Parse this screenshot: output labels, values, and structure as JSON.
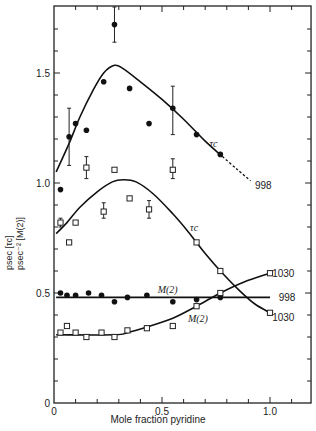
{
  "chart_data": {
    "type": "scatter",
    "title": "",
    "xlabel": "Mole fraction pyridine",
    "ylabel_line1": "psec [τc]",
    "ylabel_line2": "psec⁻² [M(2)]",
    "xlim": [
      0,
      1.19
    ],
    "ylim": [
      0,
      1.8
    ],
    "x_ticks": [
      0,
      0.5,
      1.0
    ],
    "x_tick_labels": [
      "0",
      "0.5",
      "1.0"
    ],
    "y_ticks": [
      0,
      0.5,
      1.0,
      1.5
    ],
    "y_tick_labels": [
      "0",
      "0.5",
      "1.0",
      "1.5"
    ],
    "grid": false,
    "series": [
      {
        "name": "τc (998)",
        "marker": "filled-circle",
        "points": [
          {
            "x": 0.03,
            "y": 0.97
          },
          {
            "x": 0.07,
            "y": 1.21,
            "err": [
              1.08,
              1.34
            ]
          },
          {
            "x": 0.1,
            "y": 1.27
          },
          {
            "x": 0.15,
            "y": 1.24
          },
          {
            "x": 0.23,
            "y": 1.46
          },
          {
            "x": 0.28,
            "y": 1.72,
            "err": [
              1.64,
              1.8
            ]
          },
          {
            "x": 0.35,
            "y": 1.43
          },
          {
            "x": 0.44,
            "y": 1.27
          },
          {
            "x": 0.55,
            "y": 1.34,
            "err": [
              1.22,
              1.44
            ]
          },
          {
            "x": 0.66,
            "y": 1.22
          },
          {
            "x": 0.77,
            "y": 1.13
          }
        ],
        "curve": [
          [
            0.01,
            1.05
          ],
          [
            0.07,
            1.18
          ],
          [
            0.12,
            1.3
          ],
          [
            0.18,
            1.42
          ],
          [
            0.23,
            1.5
          ],
          [
            0.28,
            1.535
          ],
          [
            0.32,
            1.52
          ],
          [
            0.4,
            1.46
          ],
          [
            0.5,
            1.38
          ],
          [
            0.6,
            1.29
          ],
          [
            0.7,
            1.19
          ],
          [
            0.78,
            1.12
          ]
        ],
        "dashed_curve": [
          [
            0.78,
            1.12
          ],
          [
            0.85,
            1.06
          ],
          [
            0.91,
            1.01
          ]
        ],
        "end_label": "998",
        "curve_label": "τc"
      },
      {
        "name": "τc (1030)",
        "marker": "open-square",
        "points": [
          {
            "x": 0.03,
            "y": 0.82,
            "err": [
              0.8,
              0.84
            ]
          },
          {
            "x": 0.07,
            "y": 0.73
          },
          {
            "x": 0.1,
            "y": 0.82
          },
          {
            "x": 0.15,
            "y": 1.07,
            "err": [
              1.02,
              1.12
            ]
          },
          {
            "x": 0.23,
            "y": 0.87,
            "err": [
              0.84,
              0.91
            ]
          },
          {
            "x": 0.28,
            "y": 1.06
          },
          {
            "x": 0.35,
            "y": 0.93
          },
          {
            "x": 0.44,
            "y": 0.88,
            "err": [
              0.84,
              0.92
            ]
          },
          {
            "x": 0.55,
            "y": 1.06,
            "err": [
              1.02,
              1.11
            ]
          },
          {
            "x": 0.66,
            "y": 0.73
          },
          {
            "x": 0.77,
            "y": 0.6
          },
          {
            "x": 1.0,
            "y": 0.41
          }
        ],
        "curve": [
          [
            0.01,
            0.77
          ],
          [
            0.06,
            0.82
          ],
          [
            0.12,
            0.89
          ],
          [
            0.2,
            0.96
          ],
          [
            0.27,
            1.005
          ],
          [
            0.32,
            1.015
          ],
          [
            0.38,
            1.005
          ],
          [
            0.46,
            0.95
          ],
          [
            0.55,
            0.86
          ],
          [
            0.62,
            0.78
          ],
          [
            0.7,
            0.68
          ],
          [
            0.78,
            0.59
          ],
          [
            0.86,
            0.51
          ],
          [
            0.93,
            0.45
          ],
          [
            1.0,
            0.41
          ]
        ],
        "end_label": "1030",
        "curve_label": "τc"
      },
      {
        "name": "M(2) (998)",
        "marker": "filled-circle",
        "points": [
          {
            "x": 0.03,
            "y": 0.5
          },
          {
            "x": 0.06,
            "y": 0.49
          },
          {
            "x": 0.1,
            "y": 0.49
          },
          {
            "x": 0.16,
            "y": 0.5
          },
          {
            "x": 0.22,
            "y": 0.49
          },
          {
            "x": 0.28,
            "y": 0.46
          },
          {
            "x": 0.34,
            "y": 0.48
          },
          {
            "x": 0.43,
            "y": 0.49
          },
          {
            "x": 0.55,
            "y": 0.46
          },
          {
            "x": 0.66,
            "y": 0.47
          },
          {
            "x": 0.77,
            "y": 0.48
          }
        ],
        "curve": [
          [
            0.01,
            0.48
          ],
          [
            1.0,
            0.48
          ]
        ],
        "end_label": "998",
        "curve_label": "M(2)"
      },
      {
        "name": "M(2) (1030)",
        "marker": "open-square",
        "points": [
          {
            "x": 0.03,
            "y": 0.32
          },
          {
            "x": 0.06,
            "y": 0.35
          },
          {
            "x": 0.1,
            "y": 0.32
          },
          {
            "x": 0.15,
            "y": 0.3
          },
          {
            "x": 0.22,
            "y": 0.32
          },
          {
            "x": 0.28,
            "y": 0.3
          },
          {
            "x": 0.34,
            "y": 0.33
          },
          {
            "x": 0.43,
            "y": 0.34
          },
          {
            "x": 0.55,
            "y": 0.35
          },
          {
            "x": 0.66,
            "y": 0.44
          },
          {
            "x": 0.77,
            "y": 0.5
          },
          {
            "x": 1.0,
            "y": 0.59
          }
        ],
        "curve": [
          [
            0.01,
            0.31
          ],
          [
            0.28,
            0.31
          ],
          [
            0.34,
            0.32
          ],
          [
            0.43,
            0.345
          ],
          [
            0.55,
            0.385
          ],
          [
            0.66,
            0.44
          ],
          [
            0.77,
            0.5
          ],
          [
            0.88,
            0.55
          ],
          [
            1.0,
            0.59
          ]
        ],
        "end_label": "1030",
        "curve_label": "M(2)"
      }
    ],
    "annotations": [
      {
        "text": "τc",
        "x": 0.72,
        "y": 1.18
      },
      {
        "text": "τc",
        "x": 0.63,
        "y": 0.8
      },
      {
        "text": "M(2)",
        "x": 0.48,
        "y": 0.515
      },
      {
        "text": "M(2)",
        "x": 0.62,
        "y": 0.385
      },
      {
        "text": "998",
        "x": 0.93,
        "y": 0.99
      },
      {
        "text": "1030",
        "x": 1.01,
        "y": 0.59
      },
      {
        "text": "998",
        "x": 1.04,
        "y": 0.48
      },
      {
        "text": "1030",
        "x": 1.01,
        "y": 0.39
      }
    ]
  }
}
